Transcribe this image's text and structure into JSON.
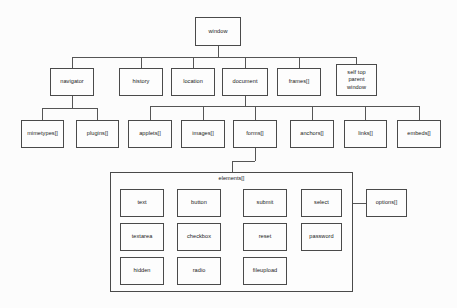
{
  "diagram": {
    "style": {
      "background": "#fcfcfc",
      "box_fill": "#fdfdfd",
      "box_stroke": "#4a4a4a",
      "line_stroke": "#555555",
      "text_color": "#1a1a1a"
    },
    "nodes": [
      {
        "id": "window",
        "label": "window",
        "x": 195,
        "y": 17,
        "w": 46,
        "h": 29
      },
      {
        "id": "navigator",
        "label": "navigator",
        "x": 50,
        "y": 68,
        "w": 44,
        "h": 28
      },
      {
        "id": "history",
        "label": "history",
        "x": 119,
        "y": 68,
        "w": 44,
        "h": 28
      },
      {
        "id": "location",
        "label": "location",
        "x": 171,
        "y": 68,
        "w": 44,
        "h": 28
      },
      {
        "id": "document",
        "label": "document",
        "x": 222,
        "y": 68,
        "w": 46,
        "h": 28
      },
      {
        "id": "frames",
        "label": "frames[]",
        "x": 277,
        "y": 68,
        "w": 44,
        "h": 28
      },
      {
        "id": "selftop",
        "label": "self top\nparent\nwindow",
        "x": 336,
        "y": 64,
        "w": 41,
        "h": 32
      },
      {
        "id": "mimetypes",
        "label": "mimetypes[]",
        "x": 21,
        "y": 120,
        "w": 43,
        "h": 28
      },
      {
        "id": "plugins",
        "label": "plugins[]",
        "x": 76,
        "y": 120,
        "w": 43,
        "h": 28
      },
      {
        "id": "applets",
        "label": "applets[]",
        "x": 128,
        "y": 120,
        "w": 44,
        "h": 28
      },
      {
        "id": "images",
        "label": "images[]",
        "x": 181,
        "y": 120,
        "w": 44,
        "h": 28
      },
      {
        "id": "forms",
        "label": "forms[]",
        "x": 233,
        "y": 120,
        "w": 44,
        "h": 28
      },
      {
        "id": "anchors",
        "label": "anchors[]",
        "x": 290,
        "y": 120,
        "w": 44,
        "h": 28
      },
      {
        "id": "links",
        "label": "links[]",
        "x": 344,
        "y": 120,
        "w": 43,
        "h": 28
      },
      {
        "id": "embeds",
        "label": "embeds[]",
        "x": 397,
        "y": 120,
        "w": 44,
        "h": 28
      },
      {
        "id": "text",
        "label": "text",
        "x": 120,
        "y": 189,
        "w": 44,
        "h": 28
      },
      {
        "id": "button",
        "label": "button",
        "x": 177,
        "y": 189,
        "w": 44,
        "h": 28
      },
      {
        "id": "submit",
        "label": "submit",
        "x": 243,
        "y": 189,
        "w": 44,
        "h": 28
      },
      {
        "id": "select",
        "label": "select",
        "x": 301,
        "y": 189,
        "w": 41,
        "h": 28
      },
      {
        "id": "options",
        "label": "options[]",
        "x": 366,
        "y": 189,
        "w": 41,
        "h": 28
      },
      {
        "id": "textarea",
        "label": "textarea",
        "x": 120,
        "y": 223,
        "w": 44,
        "h": 28
      },
      {
        "id": "checkbox",
        "label": "checkbox",
        "x": 177,
        "y": 223,
        "w": 44,
        "h": 28
      },
      {
        "id": "reset",
        "label": "reset",
        "x": 243,
        "y": 223,
        "w": 44,
        "h": 28
      },
      {
        "id": "password",
        "label": "password",
        "x": 301,
        "y": 223,
        "w": 41,
        "h": 28
      },
      {
        "id": "hidden",
        "label": "hidden",
        "x": 120,
        "y": 257,
        "w": 44,
        "h": 28
      },
      {
        "id": "radio",
        "label": "radio",
        "x": 177,
        "y": 257,
        "w": 44,
        "h": 28
      },
      {
        "id": "fileupload",
        "label": "fileupload",
        "x": 243,
        "y": 257,
        "w": 44,
        "h": 28
      }
    ],
    "groups": [
      {
        "id": "elements",
        "label": "elements[]",
        "x": 110,
        "y": 172,
        "w": 243,
        "h": 120,
        "label_x": 110,
        "label_y": 175,
        "label_w": 243
      }
    ],
    "edges": [
      {
        "from": "window",
        "to": "navigator"
      },
      {
        "from": "window",
        "to": "history"
      },
      {
        "from": "window",
        "to": "location"
      },
      {
        "from": "window",
        "to": "document"
      },
      {
        "from": "window",
        "to": "frames"
      },
      {
        "from": "window",
        "to": "selftop"
      },
      {
        "from": "navigator",
        "to": "mimetypes"
      },
      {
        "from": "navigator",
        "to": "plugins"
      },
      {
        "from": "document",
        "to": "applets"
      },
      {
        "from": "document",
        "to": "images"
      },
      {
        "from": "document",
        "to": "forms"
      },
      {
        "from": "document",
        "to": "anchors"
      },
      {
        "from": "document",
        "to": "links"
      },
      {
        "from": "document",
        "to": "embeds"
      },
      {
        "from": "forms",
        "to": "elements"
      },
      {
        "from": "select",
        "to": "options"
      }
    ]
  }
}
